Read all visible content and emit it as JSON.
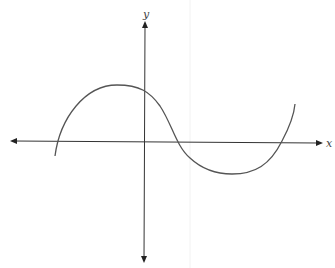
{
  "diagram": {
    "type": "function-graph",
    "axes": {
      "x_label": "x",
      "y_label": "y",
      "arrows": "both-ends"
    },
    "curve": {
      "shape": "cubic",
      "x_intercepts": 3,
      "local_max": "left of y-axis, above x-axis",
      "local_min": "right of y-axis, below x-axis",
      "y_intercept": "positive",
      "color": "#555555"
    },
    "colors": {
      "axis": "#333333",
      "curve": "#555555",
      "background": "#ffffff"
    }
  }
}
